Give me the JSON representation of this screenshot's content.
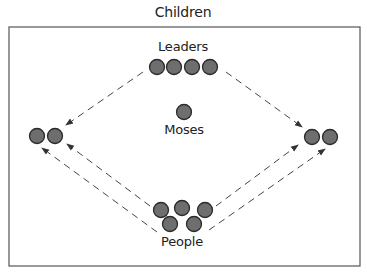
{
  "diagram": {
    "title": "Children",
    "labels": {
      "leaders": "Leaders",
      "moses": "Moses",
      "people": "People"
    },
    "colors": {
      "node_fill": "#6e6e6e",
      "node_stroke": "#2a2a2a",
      "arrow": "#444444",
      "frame": "#555555"
    },
    "nodes": {
      "leaders": [
        [
          157,
          67
        ],
        [
          174,
          67
        ],
        [
          192,
          67
        ],
        [
          210,
          67
        ]
      ],
      "moses": [
        [
          184,
          112
        ]
      ],
      "left_group": [
        [
          37,
          136
        ],
        [
          55,
          136
        ]
      ],
      "right_group": [
        [
          312,
          137
        ],
        [
          330,
          137
        ]
      ],
      "people": [
        [
          161,
          210
        ],
        [
          182,
          208
        ],
        [
          205,
          210
        ],
        [
          170,
          224
        ],
        [
          194,
          224
        ]
      ]
    },
    "arrows": [
      {
        "from": "leaders",
        "to": "left_group",
        "x1": 143,
        "y1": 72,
        "x2": 66,
        "y2": 125
      },
      {
        "from": "leaders",
        "to": "right_group",
        "x1": 226,
        "y1": 72,
        "x2": 302,
        "y2": 127
      },
      {
        "from": "people",
        "to": "left_group",
        "x1": 157,
        "y1": 232,
        "x2": 42,
        "y2": 148
      },
      {
        "from": "people",
        "to": "left_group",
        "x1": 150,
        "y1": 206,
        "x2": 67,
        "y2": 144
      },
      {
        "from": "people",
        "to": "right_group",
        "x1": 216,
        "y1": 206,
        "x2": 298,
        "y2": 145
      },
      {
        "from": "people",
        "to": "right_group",
        "x1": 209,
        "y1": 230,
        "x2": 325,
        "y2": 149
      }
    ]
  }
}
